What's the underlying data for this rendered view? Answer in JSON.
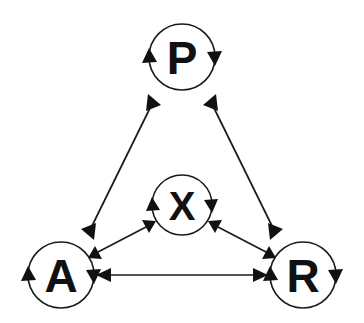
{
  "diagram": {
    "background_color": "#ffffff",
    "stroke_color": "#1a1a1a",
    "label_color": "#111111",
    "width": 364,
    "height": 323,
    "nodes": [
      {
        "id": "P",
        "label": "P",
        "cx": 182,
        "cy": 57,
        "r": 33,
        "font_size": 46,
        "self_loop": true,
        "self_loop_direction": "bidirectional"
      },
      {
        "id": "X",
        "label": "X",
        "cx": 182,
        "cy": 205,
        "r": 30,
        "font_size": 40,
        "self_loop": true,
        "self_loop_direction": "bidirectional"
      },
      {
        "id": "A",
        "label": "A",
        "cx": 61,
        "cy": 275,
        "r": 33,
        "font_size": 46,
        "self_loop": true,
        "self_loop_direction": "bidirectional"
      },
      {
        "id": "R",
        "label": "R",
        "cx": 303,
        "cy": 275,
        "r": 33,
        "font_size": 46,
        "self_loop": true,
        "self_loop_direction": "bidirectional"
      }
    ],
    "edges": [
      {
        "id": "edge-a-p",
        "from": "A",
        "to": "P",
        "direction": "bidirectional",
        "x1": 84,
        "y1": 242,
        "x2": 158,
        "y2": 92
      },
      {
        "id": "edge-p-r",
        "from": "P",
        "to": "R",
        "direction": "bidirectional",
        "x1": 206,
        "y1": 92,
        "x2": 281,
        "y2": 242
      },
      {
        "id": "edge-a-r",
        "from": "A",
        "to": "R",
        "direction": "bidirectional",
        "x1": 100,
        "y1": 275,
        "x2": 264,
        "y2": 275
      },
      {
        "id": "edge-a-x",
        "from": "A",
        "to": "X",
        "direction": "bidirectional",
        "x1": 92,
        "y1": 253,
        "x2": 152,
        "y2": 222
      },
      {
        "id": "edge-x-r",
        "from": "X",
        "to": "R",
        "direction": "bidirectional",
        "x1": 212,
        "y1": 222,
        "x2": 272,
        "y2": 253
      }
    ]
  }
}
